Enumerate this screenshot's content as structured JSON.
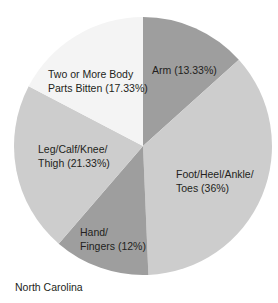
{
  "chart_data": {
    "type": "pie",
    "title": "",
    "caption": "North Carolina",
    "start_angle_deg": 0,
    "direction": "clockwise",
    "slices": [
      {
        "label": "Arm",
        "value": 13.33,
        "color": "#9e9e9e",
        "text": [
          "Arm (13.33%)"
        ]
      },
      {
        "label": "Foot/Heel/Ankle/Toes",
        "value": 36,
        "color": "#cdcdcd",
        "text": [
          "Foot/Heel/Ankle/",
          "Toes (36%)"
        ]
      },
      {
        "label": "Hand/Fingers",
        "value": 12,
        "color": "#9e9e9e",
        "text": [
          "Hand/",
          "Fingers (12%)"
        ]
      },
      {
        "label": "Leg/Calf/Knee/Thigh",
        "value": 21.33,
        "color": "#cdcdcd",
        "text": [
          "Leg/Calf/Knee/",
          "Thigh (21.33%)"
        ]
      },
      {
        "label": "Two or More Body Parts Bitten",
        "value": 17.33,
        "color": "#f4f4f4",
        "text": [
          "Two or More Body",
          "Parts Bitten (17.33%)"
        ]
      }
    ]
  },
  "labels": {
    "arm": "Arm (13.33%)",
    "foot_1": "Foot/Heel/Ankle/",
    "foot_2": "Toes (36%)",
    "hand_1": "Hand/",
    "hand_2": "Fingers (12%)",
    "leg_1": "Leg/Calf/Knee/",
    "leg_2": "Thigh (21.33%)",
    "two_1": "Two or More Body",
    "two_2": "Parts Bitten (17.33%)"
  },
  "caption": "North Carolina"
}
